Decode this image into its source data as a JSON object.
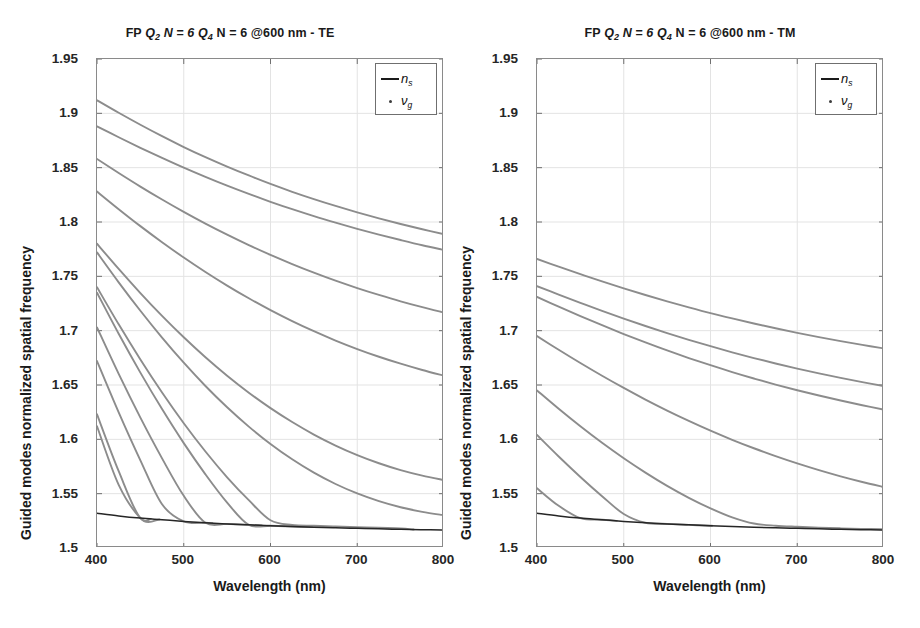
{
  "figure": {
    "width": 920,
    "height": 628,
    "background": "#ffffff"
  },
  "panels": [
    {
      "id": "left",
      "title_prefix": "FP",
      "title_q1": "Q",
      "title_q1_sub": "2",
      "title_mid1": "N = 6",
      "title_q2": "Q",
      "title_q2_sub": "4",
      "title_mid2": "N = 6 @600 nm - TE",
      "title_full": "FP Q2 N = 6 Q4 N = 6 @600 nm - TE",
      "polarization": "TE"
    },
    {
      "id": "right",
      "title_prefix": "FP",
      "title_q1": "Q",
      "title_q1_sub": "2",
      "title_mid1": "N = 6",
      "title_q2": "Q",
      "title_q2_sub": "4",
      "title_mid2": "N = 6 @600 nm - TM",
      "title_full": "FP Q2 N = 6 Q4 N = 6 @600 nm - TM",
      "polarization": "TM"
    }
  ],
  "axes": {
    "xlabel": "Wavelength (nm)",
    "ylabel": "Guided modes normalized spatial frequency",
    "xticks": [
      "400",
      "500",
      "600",
      "700",
      "800"
    ],
    "yticks": [
      "1.5",
      "1.55",
      "1.6",
      "1.65",
      "1.7",
      "1.75",
      "1.8",
      "1.85",
      "1.9",
      "1.95"
    ],
    "xlim": [
      400,
      800
    ],
    "ylim": [
      1.5,
      1.95
    ]
  },
  "legend": {
    "entries": [
      {
        "marker": "line",
        "symbol": "n",
        "sub": "s",
        "label": "n_s"
      },
      {
        "marker": "dot",
        "symbol": "ν",
        "sub": "g",
        "label": "ν_g"
      }
    ]
  },
  "style": {
    "curve_color": "#8c8c8c",
    "substrate_color": "#262626",
    "frame_color": "#8a8a8a",
    "grid_color": "#e3e3e3",
    "text_color": "#1a1a1a"
  },
  "chart_data": [
    {
      "type": "line",
      "panel": "left",
      "title": "FP Q2 N = 6 Q4 N = 6 @600 nm - TE",
      "xlabel": "Wavelength (nm)",
      "ylabel": "Guided modes normalized spatial frequency",
      "xlim": [
        400,
        800
      ],
      "ylim": [
        1.5,
        1.95
      ],
      "xticks": [
        400,
        500,
        600,
        700,
        800
      ],
      "yticks": [
        1.5,
        1.55,
        1.6,
        1.65,
        1.7,
        1.75,
        1.8,
        1.85,
        1.9,
        1.95
      ],
      "grid": true,
      "legend_position": "top-right",
      "x": [
        400,
        425,
        450,
        475,
        500,
        525,
        550,
        575,
        600,
        625,
        650,
        675,
        700,
        725,
        750,
        775,
        800
      ],
      "series": [
        {
          "name": "ns",
          "style": "line",
          "color": "#262626",
          "values": [
            1.532,
            1.5295,
            1.5275,
            1.526,
            1.5245,
            1.5232,
            1.5222,
            1.5213,
            1.5205,
            1.5198,
            1.5192,
            1.5186,
            1.5181,
            1.5176,
            1.5172,
            1.5168,
            1.5165
          ]
        },
        {
          "name": "vg mode 1",
          "style": "dot",
          "color": "#8c8c8c",
          "values": [
            1.912,
            1.9005,
            1.8895,
            1.879,
            1.869,
            1.8597,
            1.851,
            1.8428,
            1.835,
            1.8278,
            1.8211,
            1.8148,
            1.8089,
            1.8034,
            1.7982,
            1.7933,
            1.7887
          ]
        },
        {
          "name": "vg mode 2",
          "style": "dot",
          "color": "#8c8c8c",
          "values": [
            1.888,
            1.878,
            1.8683,
            1.859,
            1.85,
            1.8415,
            1.8334,
            1.8258,
            1.8186,
            1.8118,
            1.8054,
            1.7994,
            1.7937,
            1.7884,
            1.7834,
            1.7786,
            1.7742
          ]
        },
        {
          "name": "vg mode 3",
          "style": "dot",
          "color": "#8c8c8c",
          "values": [
            1.858,
            1.8451,
            1.8326,
            1.8207,
            1.8093,
            1.7985,
            1.7883,
            1.7787,
            1.7697,
            1.7613,
            1.7534,
            1.746,
            1.7392,
            1.7329,
            1.727,
            1.7216,
            1.7166
          ]
        },
        {
          "name": "vg mode 4",
          "style": "dot",
          "color": "#8c8c8c",
          "values": [
            1.828,
            1.8118,
            1.7962,
            1.7814,
            1.7673,
            1.754,
            1.7415,
            1.7298,
            1.7189,
            1.7088,
            1.6995,
            1.6909,
            1.6831,
            1.676,
            1.6696,
            1.6638,
            1.6586
          ]
        },
        {
          "name": "vg mode 5",
          "style": "dot",
          "color": "#8c8c8c",
          "values": [
            1.78,
            1.7568,
            1.7346,
            1.7136,
            1.6939,
            1.6755,
            1.6585,
            1.6429,
            1.6287,
            1.6159,
            1.6044,
            1.5943,
            1.5855,
            1.578,
            1.5717,
            1.5666,
            1.5625
          ]
        },
        {
          "name": "vg mode 6",
          "style": "dot",
          "color": "#8c8c8c",
          "values": [
            1.772,
            1.7445,
            1.7183,
            1.6936,
            1.6705,
            1.6491,
            1.6295,
            1.6117,
            1.5957,
            1.5816,
            1.5693,
            1.5589,
            1.5502,
            1.5431,
            1.5375,
            1.5333,
            1.5302
          ]
        },
        {
          "name": "vg mode 7",
          "style": "dot",
          "color": "#8c8c8c",
          "cutoff_x": 765,
          "values": [
            1.74,
            1.7058,
            1.6735,
            1.6431,
            1.6148,
            1.5888,
            1.5651,
            1.544,
            1.5255,
            1.5212,
            1.5205,
            1.5198,
            1.5192,
            1.5186,
            1.5181,
            1.5176,
            null
          ]
        },
        {
          "name": "vg mode 8",
          "style": "dot",
          "color": "#8c8c8c",
          "cutoff_x": 648,
          "values": [
            1.735,
            1.6972,
            1.6614,
            1.6278,
            1.5965,
            1.5678,
            1.5418,
            1.5213,
            1.5205,
            1.5198,
            1.5192,
            null,
            null,
            null,
            null,
            null,
            null
          ]
        },
        {
          "name": "vg mode 9",
          "style": "dot",
          "color": "#8c8c8c",
          "cutoff_x": 590,
          "values": [
            1.703,
            1.6602,
            1.62,
            1.5825,
            1.548,
            1.5232,
            1.5222,
            1.5213,
            1.5205,
            null,
            null,
            null,
            null,
            null,
            null,
            null,
            null
          ]
        },
        {
          "name": "vg mode 10",
          "style": "dot",
          "color": "#8c8c8c",
          "cutoff_x": 533,
          "values": [
            1.672,
            1.6248,
            1.5807,
            1.5402,
            1.5245,
            1.5232,
            1.5222,
            null,
            null,
            null,
            null,
            null,
            null,
            null,
            null,
            null,
            null
          ]
        },
        {
          "name": "vg mode 11",
          "style": "dot",
          "color": "#8c8c8c",
          "cutoff_x": 472,
          "values": [
            1.623,
            1.5707,
            1.5275,
            1.526,
            1.5245,
            null,
            null,
            null,
            null,
            null,
            null,
            null,
            null,
            null,
            null,
            null,
            null
          ]
        },
        {
          "name": "vg mode 12",
          "style": "dot",
          "color": "#8c8c8c",
          "cutoff_x": 462,
          "values": [
            1.612,
            1.5581,
            1.5275,
            1.526,
            null,
            null,
            null,
            null,
            null,
            null,
            null,
            null,
            null,
            null,
            null,
            null,
            null
          ]
        }
      ]
    },
    {
      "type": "line",
      "panel": "right",
      "title": "FP Q2 N = 6 Q4 N = 6 @600 nm - TM",
      "xlabel": "Wavelength (nm)",
      "ylabel": "Guided modes normalized spatial frequency",
      "xlim": [
        400,
        800
      ],
      "ylim": [
        1.5,
        1.95
      ],
      "xticks": [
        400,
        500,
        600,
        700,
        800
      ],
      "yticks": [
        1.5,
        1.55,
        1.6,
        1.65,
        1.7,
        1.75,
        1.8,
        1.85,
        1.9,
        1.95
      ],
      "grid": true,
      "legend_position": "top-right",
      "x": [
        400,
        425,
        450,
        475,
        500,
        525,
        550,
        575,
        600,
        625,
        650,
        675,
        700,
        725,
        750,
        775,
        800
      ],
      "series": [
        {
          "name": "ns",
          "style": "line",
          "color": "#262626",
          "values": [
            1.532,
            1.5295,
            1.5275,
            1.526,
            1.5245,
            1.5232,
            1.5222,
            1.5213,
            1.5205,
            1.5198,
            1.5192,
            1.5186,
            1.5181,
            1.5176,
            1.5172,
            1.5168,
            1.5165
          ]
        },
        {
          "name": "vg mode 1",
          "style": "dot",
          "color": "#8c8c8c",
          "values": [
            1.766,
            1.7589,
            1.752,
            1.7453,
            1.7389,
            1.7328,
            1.727,
            1.7215,
            1.7162,
            1.7113,
            1.7066,
            1.7022,
            1.698,
            1.6941,
            1.6904,
            1.6869,
            1.6836
          ]
        },
        {
          "name": "vg mode 2",
          "style": "dot",
          "color": "#8c8c8c",
          "values": [
            1.741,
            1.7332,
            1.7256,
            1.7182,
            1.7111,
            1.7043,
            1.6978,
            1.6916,
            1.6857,
            1.6801,
            1.6748,
            1.6698,
            1.6651,
            1.6607,
            1.6565,
            1.6526,
            1.6489
          ]
        },
        {
          "name": "vg mode 3",
          "style": "dot",
          "color": "#8c8c8c",
          "values": [
            1.731,
            1.7221,
            1.7134,
            1.705,
            1.6969,
            1.6892,
            1.6818,
            1.6748,
            1.6682,
            1.6619,
            1.656,
            1.6504,
            1.6452,
            1.6403,
            1.6357,
            1.6314,
            1.6274
          ]
        },
        {
          "name": "vg mode 4",
          "style": "dot",
          "color": "#8c8c8c",
          "values": [
            1.695,
            1.6824,
            1.6702,
            1.6585,
            1.6473,
            1.6366,
            1.6265,
            1.617,
            1.608,
            1.5996,
            1.5918,
            1.5845,
            1.5778,
            1.5716,
            1.5659,
            1.5607,
            1.556
          ]
        },
        {
          "name": "vg mode 5",
          "style": "dot",
          "color": "#8c8c8c",
          "values": [
            1.645,
            1.6281,
            1.612,
            1.5968,
            1.5826,
            1.5694,
            1.5572,
            1.5462,
            1.5365,
            1.5282,
            1.5225,
            1.5205,
            1.5195,
            1.5187,
            1.5181,
            1.5176,
            1.5172
          ]
        },
        {
          "name": "vg mode 6",
          "style": "dot",
          "color": "#8c8c8c",
          "cutoff_x": 600,
          "values": [
            1.604,
            1.5842,
            1.5654,
            1.5477,
            1.5313,
            1.5232,
            1.5222,
            1.5213,
            1.5205,
            null,
            null,
            null,
            null,
            null,
            null,
            null,
            null
          ]
        },
        {
          "name": "vg mode 7",
          "style": "dot",
          "color": "#8c8c8c",
          "cutoff_x": 492,
          "values": [
            1.555,
            1.5388,
            1.5275,
            1.526,
            null,
            null,
            null,
            null,
            null,
            null,
            null,
            null,
            null,
            null,
            null,
            null,
            null
          ]
        }
      ]
    }
  ]
}
